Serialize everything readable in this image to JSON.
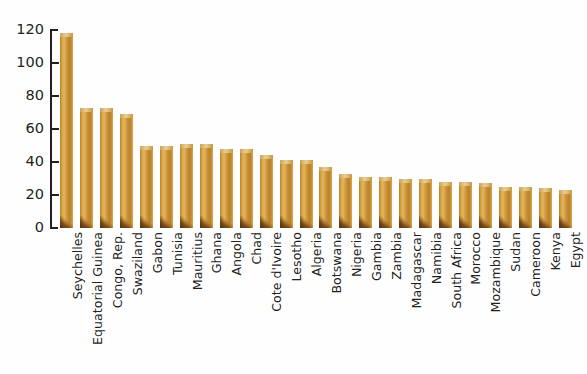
{
  "chart_data": {
    "type": "bar",
    "title": "",
    "subtitle": "",
    "xlabel": "",
    "ylabel": "",
    "ylim": [
      0,
      120
    ],
    "yticks": [
      0,
      20,
      40,
      60,
      80,
      100,
      120
    ],
    "grid": false,
    "legend": "none",
    "orientation": "vertical",
    "bar_style": "3d-gold-gradient",
    "categories": [
      "Seychelles",
      "Equatorial Guinea",
      "Congo, Rep.",
      "Swaziland",
      "Gabon",
      "Tunisia",
      "Mauritius",
      "Ghana",
      "Angola",
      "Chad",
      "Cote d'Ivoire",
      "Lesotho",
      "Algeria",
      "Botswana",
      "Nigeria",
      "Gambia",
      "Zambia",
      "Madagascar",
      "Namibia",
      "South Africa",
      "Morocco",
      "Mozambique",
      "Sudan",
      "Cameroon",
      "Kenya",
      "Egypt"
    ],
    "values": [
      118,
      73,
      73,
      69,
      50,
      50,
      51,
      51,
      48,
      48,
      44,
      41,
      41,
      37,
      33,
      31,
      31,
      30,
      30,
      28,
      28,
      27,
      25,
      25,
      24,
      23
    ],
    "series": [
      {
        "name": "Value",
        "values": [
          118,
          73,
          73,
          69,
          50,
          50,
          51,
          51,
          48,
          48,
          44,
          41,
          41,
          37,
          33,
          31,
          31,
          30,
          30,
          28,
          28,
          27,
          25,
          25,
          24,
          23
        ]
      }
    ],
    "annotations": []
  },
  "colors": {
    "bar_light": "#e2b65c",
    "bar_mid": "#c89035",
    "bar_dark": "#b9802a",
    "bar_shadow": "#4a2608",
    "axis": "#231f20",
    "text": "#231f20",
    "background": "#ffffff"
  }
}
